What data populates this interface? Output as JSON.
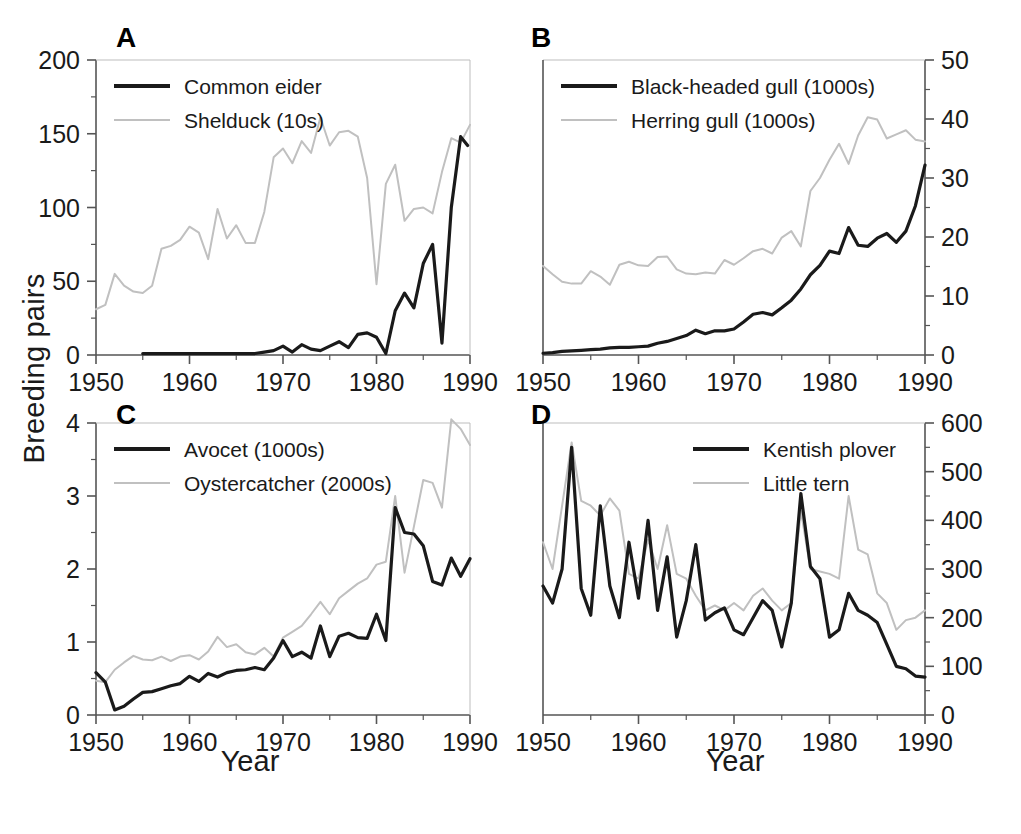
{
  "figure": {
    "ylabel": "Breeding pairs",
    "xlabel_left": "Year",
    "xlabel_right": "Year",
    "colors": {
      "dark": "#1a1a1a",
      "light": "#c0c0c0",
      "axis": "#555555"
    }
  },
  "chart_data": [
    {
      "type": "line",
      "panel": "A",
      "title": "",
      "xlabel": "Year",
      "ylabel": "Breeding pairs",
      "xlim": [
        1950,
        1990
      ],
      "ylim": [
        0,
        200
      ],
      "xticks": [
        1950,
        1960,
        1970,
        1980,
        1990
      ],
      "yticks": [
        0,
        50,
        100,
        150,
        200
      ],
      "yaxis_side": "left",
      "grid": false,
      "legend_position": "top-left",
      "series": [
        {
          "name": "Common eider",
          "color": "#1a1a1a",
          "x": [
            1955,
            1956,
            1957,
            1958,
            1965,
            1966,
            1967,
            1968,
            1969,
            1970,
            1971,
            1972,
            1973,
            1974,
            1975,
            1976,
            1977,
            1978,
            1979,
            1980,
            1981,
            1982,
            1983,
            1984,
            1985,
            1986,
            1987,
            1988,
            1989
          ],
          "y": [
            1,
            1,
            1,
            1,
            1,
            1,
            1,
            2,
            3,
            6,
            2,
            7,
            4,
            3,
            6,
            9,
            5,
            14,
            15,
            12,
            1,
            30,
            42,
            32,
            62,
            75,
            8,
            100,
            148
          ],
          "y_end_tail": 142
        },
        {
          "name": "Shelduck (10s)",
          "color": "#c0c0c0",
          "x": [
            1950,
            1951,
            1952,
            1953,
            1954,
            1955,
            1956,
            1957,
            1958,
            1959,
            1960,
            1961,
            1962,
            1963,
            1964,
            1965,
            1966,
            1967,
            1968,
            1969,
            1970,
            1971,
            1972,
            1973,
            1974,
            1975,
            1976,
            1977,
            1978,
            1979,
            1980,
            1981,
            1982,
            1983,
            1984,
            1985,
            1986,
            1987,
            1988,
            1989,
            1990
          ],
          "y": [
            31,
            34,
            55,
            47,
            43,
            42,
            47,
            72,
            74,
            78,
            87,
            83,
            65,
            99,
            79,
            88,
            76,
            76,
            97,
            134,
            140,
            130,
            145,
            137,
            161,
            142,
            151,
            152,
            148,
            120,
            48,
            116,
            129,
            91,
            99,
            100,
            96,
            124,
            147,
            144,
            156
          ]
        }
      ]
    },
    {
      "type": "line",
      "panel": "B",
      "title": "",
      "xlabel": "Year",
      "ylabel": "Breeding pairs",
      "xlim": [
        1950,
        1990
      ],
      "ylim": [
        0,
        50
      ],
      "xticks": [
        1950,
        1960,
        1970,
        1980,
        1990
      ],
      "yticks": [
        0,
        10,
        20,
        30,
        40,
        50
      ],
      "yaxis_side": "right",
      "grid": false,
      "legend_position": "top-left",
      "series": [
        {
          "name": "Black-headed gull (1000s)",
          "color": "#1a1a1a",
          "x": [
            1950,
            1951,
            1952,
            1953,
            1954,
            1955,
            1956,
            1957,
            1958,
            1959,
            1960,
            1961,
            1962,
            1963,
            1964,
            1965,
            1966,
            1967,
            1968,
            1969,
            1970,
            1971,
            1972,
            1973,
            1974,
            1975,
            1976,
            1977,
            1978,
            1979,
            1980,
            1981,
            1982,
            1983,
            1984,
            1985,
            1986,
            1987,
            1988,
            1989,
            1990
          ],
          "y": [
            0.3,
            0.4,
            0.6,
            0.7,
            0.8,
            0.9,
            1.0,
            1.2,
            1.3,
            1.3,
            1.4,
            1.5,
            2.0,
            2.3,
            2.8,
            3.3,
            4.2,
            3.6,
            4.1,
            4.1,
            4.4,
            5.6,
            6.9,
            7.2,
            6.8,
            8.0,
            9.3,
            11.2,
            13.6,
            15.2,
            17.6,
            17.2,
            21.6,
            18.6,
            18.4,
            19.8,
            20.6,
            19.1,
            21.0,
            25.3,
            32.2
          ]
        },
        {
          "name": "Herring gull (1000s)",
          "color": "#c0c0c0",
          "x": [
            1950,
            1951,
            1952,
            1953,
            1954,
            1955,
            1956,
            1957,
            1958,
            1959,
            1960,
            1961,
            1962,
            1963,
            1964,
            1965,
            1966,
            1967,
            1968,
            1969,
            1970,
            1971,
            1972,
            1973,
            1974,
            1975,
            1976,
            1977,
            1978,
            1979,
            1980,
            1981,
            1982,
            1983,
            1984,
            1985,
            1986,
            1987,
            1988,
            1989,
            1990
          ],
          "y": [
            15.1,
            13.7,
            12.4,
            12.1,
            12.1,
            14.2,
            13.3,
            11.9,
            15.3,
            15.8,
            15.2,
            15.1,
            16.6,
            16.7,
            14.5,
            13.8,
            13.7,
            14.0,
            13.8,
            16.1,
            15.3,
            16.4,
            17.6,
            18.0,
            17.2,
            19.9,
            21.0,
            18.4,
            27.8,
            30.0,
            33.1,
            35.8,
            32.4,
            37.2,
            40.3,
            39.9,
            36.7,
            37.4,
            38.1,
            36.5,
            36.2
          ]
        }
      ]
    },
    {
      "type": "line",
      "panel": "C",
      "title": "",
      "xlabel": "Year",
      "ylabel": "Breeding pairs",
      "xlim": [
        1950,
        1990
      ],
      "ylim": [
        0,
        4
      ],
      "xticks": [
        1950,
        1960,
        1970,
        1980,
        1990
      ],
      "yticks": [
        0,
        1,
        2,
        3,
        4
      ],
      "yaxis_side": "left",
      "grid": false,
      "legend_position": "top-left",
      "series": [
        {
          "name": "Avocet (1000s)",
          "color": "#1a1a1a",
          "x": [
            1950,
            1951,
            1952,
            1953,
            1954,
            1955,
            1956,
            1957,
            1958,
            1959,
            1960,
            1961,
            1962,
            1963,
            1964,
            1965,
            1966,
            1967,
            1968,
            1969,
            1970,
            1971,
            1972,
            1973,
            1974,
            1975,
            1976,
            1977,
            1978,
            1979,
            1980,
            1981,
            1982,
            1983,
            1984,
            1985,
            1986,
            1987,
            1988,
            1989,
            1990
          ],
          "y": [
            0.58,
            0.45,
            0.07,
            0.12,
            0.22,
            0.31,
            0.32,
            0.36,
            0.4,
            0.43,
            0.53,
            0.46,
            0.57,
            0.52,
            0.58,
            0.61,
            0.62,
            0.65,
            0.62,
            0.78,
            1.02,
            0.8,
            0.86,
            0.78,
            1.22,
            0.8,
            1.08,
            1.12,
            1.06,
            1.05,
            1.38,
            1.02,
            2.84,
            2.5,
            2.48,
            2.32,
            1.83,
            1.78,
            2.15,
            1.9,
            2.14
          ]
        },
        {
          "name": "Oystercatcher (2000s)",
          "color": "#c0c0c0",
          "x": [
            1950,
            1951,
            1952,
            1953,
            1954,
            1955,
            1956,
            1957,
            1958,
            1959,
            1960,
            1961,
            1962,
            1963,
            1964,
            1965,
            1966,
            1967,
            1968,
            1969,
            1970,
            1971,
            1972,
            1973,
            1974,
            1975,
            1976,
            1977,
            1978,
            1979,
            1980,
            1981,
            1982,
            1983,
            1984,
            1985,
            1986,
            1987,
            1988,
            1989,
            1990
          ],
          "y": [
            0.47,
            0.45,
            0.62,
            0.72,
            0.81,
            0.76,
            0.75,
            0.8,
            0.74,
            0.8,
            0.82,
            0.76,
            0.87,
            1.07,
            0.93,
            0.97,
            0.86,
            0.83,
            0.92,
            0.8,
            1.06,
            1.14,
            1.22,
            1.38,
            1.55,
            1.38,
            1.6,
            1.7,
            1.8,
            1.87,
            2.06,
            2.1,
            3.0,
            1.95,
            2.58,
            3.22,
            3.18,
            2.84,
            4.05,
            3.92,
            3.7
          ]
        }
      ]
    },
    {
      "type": "line",
      "panel": "D",
      "title": "",
      "xlabel": "Year",
      "ylabel": "Breeding pairs",
      "xlim": [
        1950,
        1990
      ],
      "ylim": [
        0,
        600
      ],
      "xticks": [
        1950,
        1960,
        1970,
        1980,
        1990
      ],
      "yticks": [
        0,
        100,
        200,
        300,
        400,
        500,
        600
      ],
      "yaxis_side": "right",
      "grid": false,
      "legend_position": "top-right",
      "series": [
        {
          "name": "Kentish plover",
          "color": "#1a1a1a",
          "x": [
            1950,
            1951,
            1952,
            1953,
            1954,
            1955,
            1956,
            1957,
            1958,
            1959,
            1960,
            1961,
            1962,
            1963,
            1964,
            1965,
            1966,
            1967,
            1968,
            1969,
            1970,
            1971,
            1972,
            1973,
            1974,
            1975,
            1976,
            1977,
            1978,
            1979,
            1980,
            1981,
            1982,
            1983,
            1984,
            1985,
            1986,
            1987,
            1988,
            1989,
            1990
          ],
          "y": [
            265,
            230,
            300,
            550,
            260,
            205,
            430,
            265,
            200,
            355,
            240,
            400,
            215,
            325,
            160,
            235,
            350,
            195,
            210,
            220,
            175,
            165,
            200,
            235,
            215,
            140,
            230,
            455,
            305,
            280,
            160,
            175,
            250,
            215,
            205,
            190,
            145,
            100,
            95,
            80,
            78
          ]
        },
        {
          "name": "Little tern",
          "color": "#c0c0c0",
          "x": [
            1950,
            1951,
            1952,
            1953,
            1954,
            1955,
            1956,
            1957,
            1958,
            1959,
            1960,
            1961,
            1962,
            1963,
            1964,
            1965,
            1966,
            1967,
            1968,
            1969,
            1970,
            1971,
            1972,
            1973,
            1974,
            1975,
            1976,
            1977,
            1978,
            1979,
            1980,
            1981,
            1982,
            1983,
            1984,
            1985,
            1986,
            1987,
            1988,
            1989,
            1990
          ],
          "y": [
            355,
            300,
            430,
            560,
            440,
            430,
            410,
            445,
            420,
            290,
            280,
            360,
            300,
            390,
            290,
            280,
            245,
            215,
            225,
            215,
            230,
            215,
            245,
            260,
            235,
            215,
            230,
            420,
            300,
            295,
            290,
            280,
            450,
            340,
            330,
            250,
            230,
            175,
            195,
            200,
            215
          ]
        }
      ]
    }
  ],
  "panels": {
    "A": {
      "letter": "A",
      "legend": [
        {
          "label": "Common eider",
          "style": "solid-dark"
        },
        {
          "label": "Shelduck (10s)",
          "style": "solid-light"
        }
      ],
      "ytick_labels": [
        "0",
        "50",
        "100",
        "150",
        "200"
      ],
      "xtick_labels": [
        "1950",
        "1960",
        "1970",
        "1980",
        "1990"
      ]
    },
    "B": {
      "letter": "B",
      "legend": [
        {
          "label": "Black-headed gull (1000s)",
          "style": "solid-dark"
        },
        {
          "label": "Herring gull (1000s)",
          "style": "solid-light"
        }
      ],
      "ytick_labels": [
        "0",
        "10",
        "20",
        "30",
        "40",
        "50"
      ],
      "xtick_labels": [
        "1950",
        "1960",
        "1970",
        "1980",
        "1990"
      ]
    },
    "C": {
      "letter": "C",
      "legend": [
        {
          "label": "Avocet (1000s)",
          "style": "solid-dark"
        },
        {
          "label": "Oystercatcher (2000s)",
          "style": "solid-light"
        }
      ],
      "ytick_labels": [
        "0",
        "1",
        "2",
        "3",
        "4"
      ],
      "xtick_labels": [
        "1950",
        "1960",
        "1970",
        "1980",
        "1990"
      ]
    },
    "D": {
      "letter": "D",
      "legend": [
        {
          "label": "Kentish plover",
          "style": "solid-dark"
        },
        {
          "label": "Little tern",
          "style": "solid-light"
        }
      ],
      "ytick_labels": [
        "0",
        "100",
        "200",
        "300",
        "400",
        "500",
        "600"
      ],
      "xtick_labels": [
        "1950",
        "1960",
        "1970",
        "1980",
        "1990"
      ]
    }
  }
}
